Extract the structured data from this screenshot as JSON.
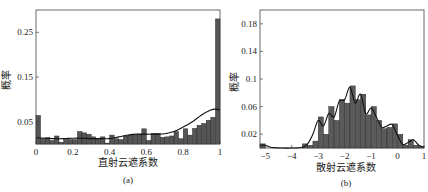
{
  "chart_data": [
    {
      "type": "bar",
      "panel": "(a)",
      "caption": "(a)",
      "xlabel": "直射云遮系数",
      "ylabel": "概率",
      "xlim": [
        0,
        1
      ],
      "ylim": [
        0,
        0.3
      ],
      "xticks": [
        "0",
        "0.2",
        "0.4",
        "0.6",
        "0.8",
        "1"
      ],
      "xtick_values": [
        0,
        0.2,
        0.4,
        0.6,
        0.8,
        1
      ],
      "yticks": [
        "0.05",
        "0.15",
        "0.25"
      ],
      "ytick_values": [
        0.05,
        0.15,
        0.25
      ],
      "bin_width": 0.025,
      "bin_starts": [
        0,
        0.025,
        0.05,
        0.075,
        0.1,
        0.125,
        0.15,
        0.175,
        0.2,
        0.225,
        0.25,
        0.275,
        0.3,
        0.325,
        0.35,
        0.375,
        0.4,
        0.425,
        0.45,
        0.475,
        0.5,
        0.525,
        0.55,
        0.575,
        0.6,
        0.625,
        0.65,
        0.675,
        0.7,
        0.725,
        0.75,
        0.775,
        0.8,
        0.825,
        0.85,
        0.875,
        0.9,
        0.925,
        0.95,
        0.975
      ],
      "values": [
        0.064,
        0.012,
        0.014,
        0.008,
        0.018,
        0.004,
        0.01,
        0.01,
        0.01,
        0.028,
        0.025,
        0.022,
        0.016,
        0.013,
        0.016,
        0.002,
        0.02,
        0.012,
        0.01,
        0.018,
        0.02,
        0.02,
        0.022,
        0.034,
        0.008,
        0.024,
        0.024,
        0.015,
        0.016,
        0.018,
        0.028,
        0.012,
        0.034,
        0.02,
        0.035,
        0.042,
        0.046,
        0.053,
        0.06,
        0.28
      ],
      "curve": {
        "x": [
          0,
          0.05,
          0.1,
          0.15,
          0.2,
          0.25,
          0.3,
          0.35,
          0.4,
          0.45,
          0.5,
          0.55,
          0.6,
          0.65,
          0.7,
          0.75,
          0.8,
          0.85,
          0.9,
          0.95,
          0.975,
          1
        ],
        "y": [
          0.014,
          0.013,
          0.012,
          0.012,
          0.013,
          0.013,
          0.012,
          0.012,
          0.012,
          0.016,
          0.02,
          0.022,
          0.022,
          0.022,
          0.023,
          0.028,
          0.038,
          0.05,
          0.065,
          0.076,
          0.078,
          0.076
        ]
      }
    },
    {
      "type": "bar",
      "panel": "(b)",
      "caption": "(b)",
      "xlabel": "散射云遮系数",
      "ylabel": "概率",
      "xlim": [
        -5.2,
        1
      ],
      "ylim": [
        0,
        0.2
      ],
      "xticks": [
        "−5",
        "−4",
        "−3",
        "−2",
        "−1",
        "0",
        "1"
      ],
      "xtick_values": [
        -5,
        -4,
        -3,
        -2,
        -1,
        0,
        1
      ],
      "yticks": [
        "0.02",
        "0.06",
        "0.1",
        "0.14",
        "0.18"
      ],
      "ytick_values": [
        0.02,
        0.06,
        0.1,
        0.14,
        0.18
      ],
      "bin_width": 0.2,
      "bin_starts": [
        -5.2,
        -5.0,
        -4.8,
        -4.6,
        -4.4,
        -4.2,
        -4.0,
        -3.8,
        -3.6,
        -3.4,
        -3.2,
        -3.0,
        -2.8,
        -2.6,
        -2.4,
        -2.2,
        -2.0,
        -1.8,
        -1.6,
        -1.4,
        -1.2,
        -1.0,
        -0.8,
        -0.6,
        -0.4,
        -0.2,
        0.0,
        0.2,
        0.4,
        0.6,
        0.8
      ],
      "values": [
        0.006,
        0.0,
        0.0,
        0.0,
        0.0,
        0.0,
        0.0,
        0.0,
        0.006,
        0.004,
        0.01,
        0.045,
        0.02,
        0.06,
        0.04,
        0.07,
        0.065,
        0.09,
        0.07,
        0.078,
        0.048,
        0.06,
        0.04,
        0.028,
        0.03,
        0.035,
        0.02,
        0.004,
        0.012,
        0.004,
        0.002
      ],
      "curve": {
        "x": [
          -5.2,
          -5.0,
          -4.8,
          -4.4,
          -4.0,
          -3.6,
          -3.4,
          -3.2,
          -3.0,
          -2.8,
          -2.6,
          -2.4,
          -2.2,
          -2.0,
          -1.8,
          -1.6,
          -1.4,
          -1.2,
          -1.0,
          -0.8,
          -0.6,
          -0.4,
          -0.2,
          0.0,
          0.2,
          0.4,
          0.6,
          0.8,
          1.0
        ],
        "y": [
          0.004,
          0.004,
          0.001,
          0.0,
          0.0,
          0.001,
          0.006,
          0.02,
          0.04,
          0.032,
          0.05,
          0.045,
          0.068,
          0.07,
          0.088,
          0.065,
          0.078,
          0.05,
          0.058,
          0.045,
          0.03,
          0.032,
          0.034,
          0.018,
          0.005,
          0.008,
          0.012,
          0.004,
          0.001
        ]
      }
    }
  ]
}
